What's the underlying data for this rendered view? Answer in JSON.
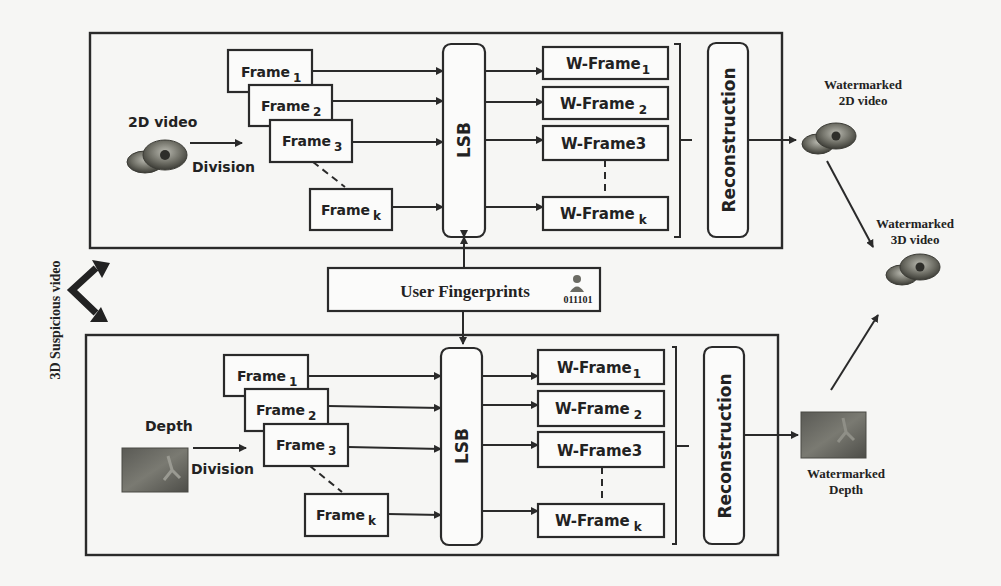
{
  "diagram": {
    "side_label": "3D Suspicious video",
    "top_panel": {
      "input_label": "2D video",
      "division_label": "Division",
      "frames": [
        {
          "base": "Frame",
          "sub": "1"
        },
        {
          "base": "Frame",
          "sub": "2"
        },
        {
          "base": "Frame",
          "sub": "3"
        },
        {
          "base": "Frame",
          "sub": "k"
        }
      ],
      "lsb_label": "LSB",
      "wframes": [
        {
          "base": "W-Frame",
          "sub": "1"
        },
        {
          "base": "W-Frame",
          "sub": "2"
        },
        {
          "base": "W-Frame3",
          "sub": ""
        },
        {
          "base": "W-Frame",
          "sub": "k"
        }
      ],
      "reconstruction_label": "Reconstruction",
      "output_label_line1": "Watermarked",
      "output_label_line2": "2D video"
    },
    "fingerprint": {
      "label": "User Fingerprints",
      "bits": "011101"
    },
    "bottom_panel": {
      "input_label": "Depth",
      "division_label": "Division",
      "frames": [
        {
          "base": "Frame",
          "sub": "1"
        },
        {
          "base": "Frame",
          "sub": "2"
        },
        {
          "base": "Frame",
          "sub": "3"
        },
        {
          "base": "Frame",
          "sub": "k"
        }
      ],
      "lsb_label": "LSB",
      "wframes": [
        {
          "base": "W-Frame",
          "sub": "1"
        },
        {
          "base": "W-Frame",
          "sub": "2"
        },
        {
          "base": "W-Frame3",
          "sub": ""
        },
        {
          "base": "W-Frame",
          "sub": "k"
        }
      ],
      "reconstruction_label": "Reconstruction",
      "output_label_line1": "Watermarked",
      "output_label_line2": "Depth"
    },
    "final_output": {
      "label_line1": "Watermarked",
      "label_line2": "3D video"
    }
  }
}
